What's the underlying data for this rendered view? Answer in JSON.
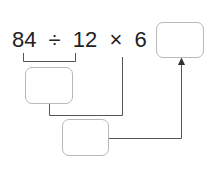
{
  "expression": {
    "n1": "84",
    "op1": "÷",
    "n2": "12",
    "op2": "×",
    "n3": "6",
    "eq": "="
  },
  "boxes": {
    "intermediate_1": "",
    "intermediate_2": "",
    "answer": ""
  },
  "colors": {
    "text": "#222222",
    "line": "#555555",
    "box_border": "#b8b8b8"
  }
}
